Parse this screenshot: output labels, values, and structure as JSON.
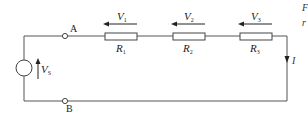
{
  "circuit": {
    "source": {
      "label": "V",
      "subscript": "S"
    },
    "terminals": {
      "a": "A",
      "b": "B"
    },
    "resistors": [
      {
        "label": "R",
        "subscript": "1",
        "voltage_label": "V",
        "voltage_subscript": "1"
      },
      {
        "label": "R",
        "subscript": "2",
        "voltage_label": "V",
        "voltage_subscript": "2"
      },
      {
        "label": "R",
        "subscript": "3",
        "voltage_label": "V",
        "voltage_subscript": "3"
      }
    ],
    "current": {
      "label": "I"
    }
  },
  "cropped_text": {
    "line1": "F",
    "line2": "r"
  },
  "colors": {
    "line": "#555555",
    "text": "#222222",
    "background": "#ffffff"
  }
}
